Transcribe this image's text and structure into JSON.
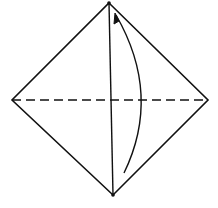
{
  "diagram": {
    "type": "origami-fold-step",
    "colors": {
      "background": "#ffffff",
      "stroke": "#111111"
    },
    "vertices": {
      "top": [
        109,
        3
      ],
      "right": [
        208,
        100
      ],
      "bottom": [
        113,
        195
      ],
      "left": [
        12,
        100
      ]
    },
    "crease_line": {
      "from": [
        109,
        3
      ],
      "to": [
        113,
        195
      ],
      "style": "solid"
    },
    "fold_line": {
      "from": [
        12,
        100
      ],
      "to": [
        208,
        100
      ],
      "style": "dashed"
    },
    "arrow": {
      "from": [
        124,
        173
      ],
      "control": [
        160,
        90
      ],
      "to": [
        115,
        14
      ],
      "direction": "up"
    }
  }
}
